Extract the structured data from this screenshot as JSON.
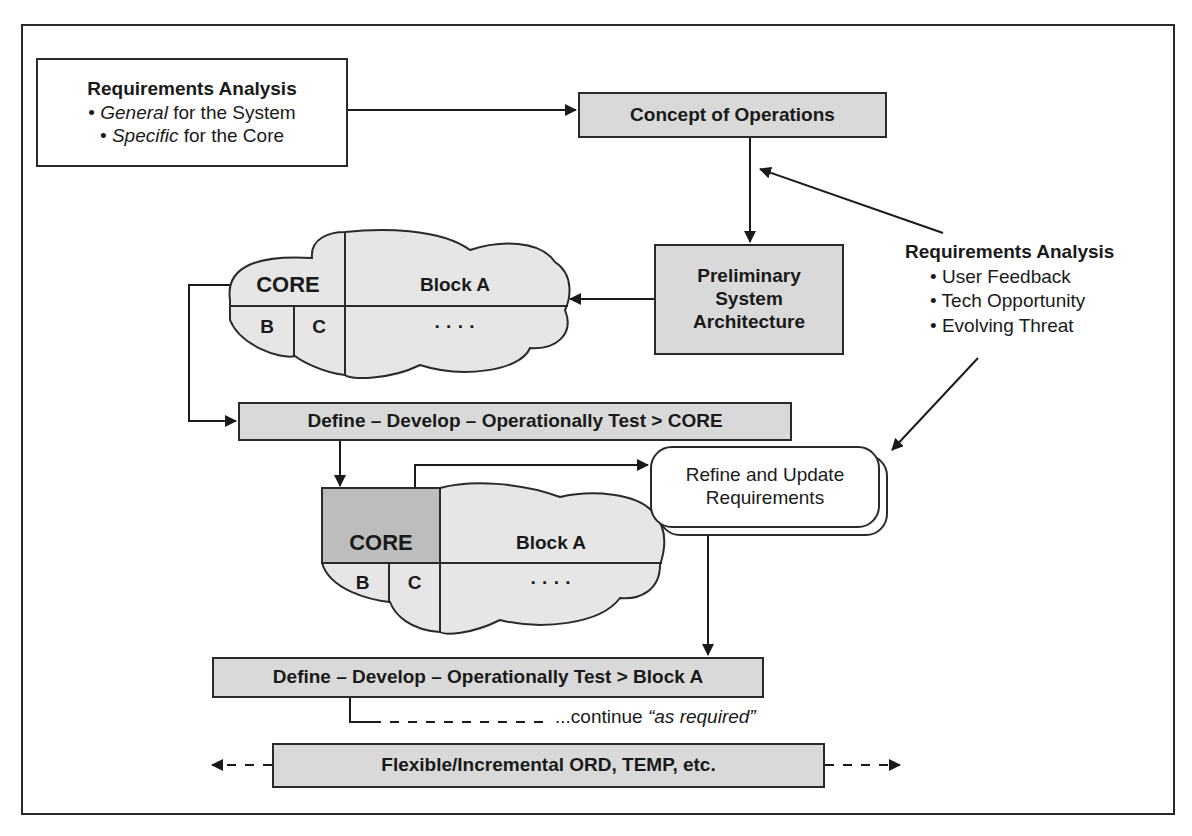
{
  "requirements_box": {
    "title": "Requirements Analysis",
    "line1_em": "General",
    "line1_rest": " for the System",
    "line2_em": "Specific",
    "line2_rest": " for the Core",
    "bullet": "•"
  },
  "concept_box": {
    "label": "Concept of Operations"
  },
  "prelim_box": {
    "line1": "Preliminary",
    "line2": "System",
    "line3": "Architecture"
  },
  "right_requirements": {
    "title": "Requirements Analysis",
    "items": [
      "• User Feedback",
      "• Tech Opportunity",
      "• Evolving Threat"
    ]
  },
  "cloud1": {
    "core": "CORE",
    "block": "Block A",
    "b": "B",
    "c": "C",
    "dots": "· · · ·"
  },
  "define_core": {
    "label": "Define –  Develop – Operationally Test > CORE"
  },
  "refine_box": {
    "line1": "Refine and Update",
    "line2": "Requirements"
  },
  "cloud2": {
    "core": "CORE",
    "block": "Block A",
    "b": "B",
    "c": "C",
    "dots": "· · · ·"
  },
  "define_block": {
    "label": "Define – Develop – Operationally Test > Block A"
  },
  "continue_text": {
    "prefix": "...continue ",
    "em": "“as required”"
  },
  "bottom_bar": {
    "label": "Flexible/Incremental ORD, TEMP, etc."
  },
  "colors": {
    "box_fill": "#d9d9d9",
    "cloud_fill": "#e6e6e6",
    "core_fill": "#bdbdbd",
    "stroke": "#2a2a2a"
  }
}
